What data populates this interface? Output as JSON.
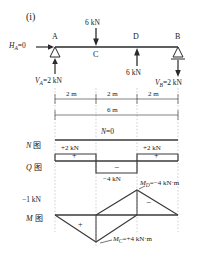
{
  "figure": {
    "label": "(i)",
    "beam": {
      "nodes": [
        {
          "name": "A",
          "type": "pin-support",
          "x_m": 0
        },
        {
          "name": "C",
          "type": "point",
          "x_m": 2
        },
        {
          "name": "D",
          "type": "point",
          "x_m": 4
        },
        {
          "name": "B",
          "type": "roller-support",
          "x_m": 6
        }
      ],
      "loads": [
        {
          "label": "6 kN",
          "at": "C",
          "direction": "down",
          "magnitude_kN": 6
        },
        {
          "label": "6 kN",
          "at": "D",
          "direction": "up",
          "magnitude_kN": 6
        }
      ],
      "reactions": [
        {
          "label": "H",
          "subscript": "A",
          "text": "Hₐ=0",
          "value": "0",
          "at": "A"
        },
        {
          "label": "V",
          "subscript": "A",
          "text": "Vₐ=2 kN",
          "value": "2 kN",
          "at": "A",
          "direction": "up"
        },
        {
          "label": "V",
          "subscript": "B",
          "text": "Vʙ=2 kN",
          "value": "2 kN",
          "at": "B",
          "direction": "down"
        }
      ],
      "reaction_H_name": "H",
      "reaction_H_sub": "A",
      "reaction_H_val": "=0",
      "reaction_VA_name": "V",
      "reaction_VA_sub": "A",
      "reaction_VA_val": "=2 kN",
      "reaction_VB_name": "V",
      "reaction_VB_sub": "B",
      "reaction_VB_val": "=2 kN",
      "load_c_label": "6 kN",
      "load_d_label": "6 kN"
    },
    "dimensions": {
      "segments": [
        "2 m",
        "2 m",
        "2 m"
      ],
      "total": "6 m"
    },
    "diagrams": [
      {
        "id": "N",
        "name_label": "N",
        "cjk_label": "图",
        "annotation": "N=0",
        "annotation_var": "N",
        "annotation_rest": "=0",
        "values": [
          {
            "segment": "A-C",
            "value": 0,
            "label": ""
          },
          {
            "segment": "C-D",
            "value": 0,
            "label": ""
          },
          {
            "segment": "D-B",
            "value": 0,
            "label": ""
          }
        ]
      },
      {
        "id": "Q",
        "name_label": "Q",
        "cjk_label": "图",
        "values": [
          {
            "segment": "A-C",
            "value": 2,
            "label": "+2 kN",
            "sign": "+"
          },
          {
            "segment": "C-D",
            "value": -4,
            "label": "−4 kN",
            "sign": "−"
          },
          {
            "segment": "D-B",
            "value": 2,
            "label": "+2 kN",
            "sign": "+"
          }
        ],
        "label_left": "+2 kN",
        "label_right": "+2 kN",
        "label_mid": "−4 kN",
        "sign_left": "+",
        "sign_right": "+",
        "sign_mid": "−"
      },
      {
        "id": "M",
        "name_label": "M",
        "cjk_label": "图",
        "corner_label": "−1 kN",
        "values": [
          {
            "point": "A",
            "value": 0
          },
          {
            "point": "C",
            "value": 4,
            "label": "Mᴄ=+4 kN·m"
          },
          {
            "point": "D",
            "value": -4,
            "label": "Mᴅ=−4 kN·m"
          },
          {
            "point": "B",
            "value": 0
          }
        ],
        "mc_var": "M",
        "mc_sub": "C",
        "mc_rest": "=+4 kN·m",
        "md_var": "M",
        "md_sub": "D",
        "md_rest": "=−4 kN·m",
        "sign_positive": "+",
        "sign_negative": "−"
      }
    ]
  },
  "colors": {
    "ink": "#1a1a1a",
    "line": "#3a3a3a",
    "guide": "#b8b8b8",
    "background": "#ffffff"
  }
}
